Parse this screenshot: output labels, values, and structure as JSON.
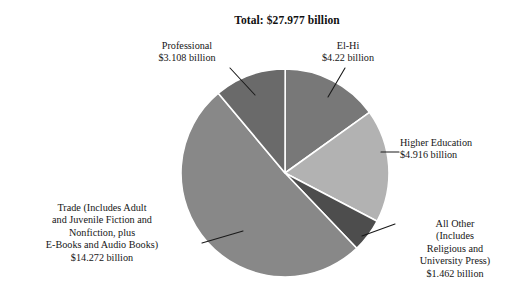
{
  "chart_data": {
    "type": "pie",
    "title": "Total: $27.977 billion",
    "unit": "billion USD",
    "total": 27.977,
    "xlabel": "",
    "ylabel": "",
    "grid": false,
    "legend": "none (direct labels with leader lines)",
    "start_angle_deg": 0,
    "direction": "clockwise",
    "categories": [
      "El-Hi",
      "Higher Education",
      "All Other (Includes Religious and University Press)",
      "Trade (Includes Adult and Juvenile Fiction and Nonfiction, plus E-Books and Audio Books)",
      "Professional"
    ],
    "values": [
      4.22,
      4.916,
      1.462,
      14.272,
      3.108
    ],
    "slices": [
      {
        "name": "el-hi",
        "label": "El-Hi",
        "value_label": "$4.22 billion",
        "value": 4.22,
        "percent": 15.1,
        "color": "#787878",
        "start_deg": 0,
        "sweep_deg": 54.3
      },
      {
        "name": "higher-education",
        "label": "Higher Education",
        "value_label": "$4.916 billion",
        "value": 4.916,
        "percent": 17.6,
        "color": "#b2b2b2",
        "start_deg": 54.3,
        "sweep_deg": 63.3
      },
      {
        "name": "all-other",
        "label": "All Other (Includes Religious and University Press)",
        "value_label": "$1.462 billion",
        "value": 1.462,
        "percent": 5.2,
        "color": "#4d4d4d",
        "start_deg": 117.6,
        "sweep_deg": 18.8
      },
      {
        "name": "trade",
        "label": "Trade (Includes Adult and Juvenile Fiction and Nonfiction, plus E-Books and Audio Books)",
        "value_label": "$14.272 billion",
        "value": 14.272,
        "percent": 51.0,
        "color": "#888888",
        "start_deg": 136.4,
        "sweep_deg": 183.7
      },
      {
        "name": "professional",
        "label": "Professional",
        "value_label": "$3.108 billion",
        "value": 3.108,
        "percent": 11.1,
        "color": "#6a6a6a",
        "start_deg": 320.1,
        "sweep_deg": 40.0
      }
    ]
  },
  "title": {
    "text": "Total: $27.977 billion"
  },
  "callouts": {
    "professional": "Professional\n$3.108 billion",
    "elhi": "El-Hi\n$4.22 billion",
    "higher_education": "Higher Education\n$4.916 billion",
    "all_other": "All Other\n(Includes\nReligious and\nUniversity Press)\n$1.462 billion",
    "trade": "Trade (Includes Adult\nand Juvenile Fiction and\nNonfiction, plus\nE-Books and Audio Books)\n$14.272 billion"
  },
  "colors": {
    "background": "#ffffff",
    "text": "#161616",
    "leader_line": "#1a1a1a",
    "slice_divider": "#ffffff"
  }
}
